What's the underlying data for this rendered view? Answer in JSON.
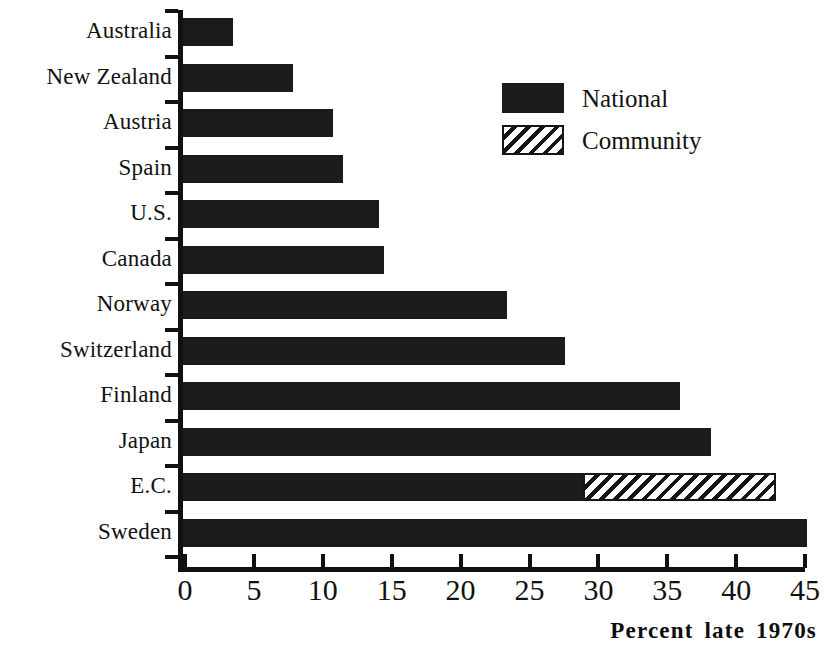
{
  "chart_data": {
    "type": "bar",
    "orientation": "horizontal",
    "title": "",
    "xlabel": "Percent late 1970s",
    "ylabel": "",
    "xlim": [
      0,
      45
    ],
    "xticks": [
      0,
      5,
      10,
      15,
      20,
      25,
      30,
      35,
      40,
      45
    ],
    "grid": false,
    "legend_position": "upper-right",
    "stacked": true,
    "categories": [
      "Australia",
      "New Zealand",
      "Austria",
      "Spain",
      "U.S.",
      "Canada",
      "Norway",
      "Switzerland",
      "Finland",
      "Japan",
      "E.C.",
      "Sweden"
    ],
    "series": [
      {
        "name": "National",
        "fill": "solid",
        "color": "#1b1b1b",
        "values": [
          3.6,
          8.0,
          10.9,
          11.6,
          14.2,
          14.6,
          23.5,
          27.7,
          36.1,
          38.3,
          29.0,
          45.3
        ]
      },
      {
        "name": "Community",
        "fill": "diagonal-hatch",
        "color": "#161616",
        "values": [
          0,
          0,
          0,
          0,
          0,
          0,
          0,
          0,
          0,
          0,
          14.0,
          0
        ]
      }
    ],
    "legend": [
      "National",
      "Community"
    ]
  },
  "axis": {
    "x_title": "Percent late 1970s",
    "tick_labels": [
      "0",
      "5",
      "10",
      "15",
      "20",
      "25",
      "30",
      "35",
      "40",
      "45"
    ]
  },
  "legend": {
    "items": [
      {
        "label": "National",
        "fill": "solid"
      },
      {
        "label": "Community",
        "fill": "diagonal-hatch"
      }
    ]
  },
  "caption": {
    "fragment": ""
  }
}
